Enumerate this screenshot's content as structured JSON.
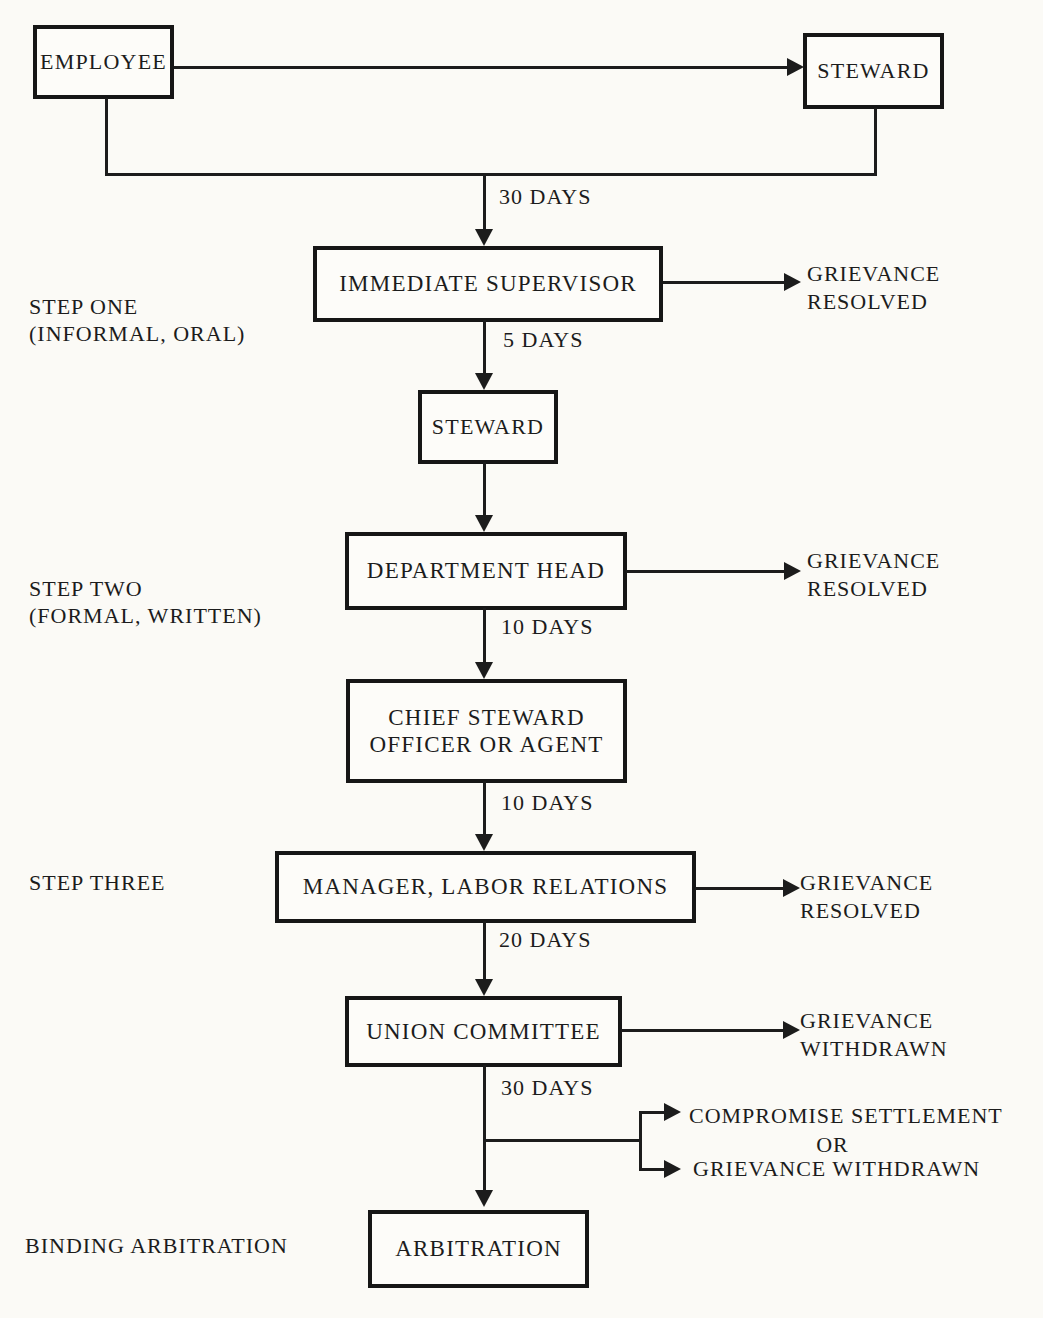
{
  "colors": {
    "ink": "#1c1c1c",
    "paper": "#fbfaf6",
    "box_fill": "#fdfcf9"
  },
  "boxes": {
    "employee": "EMPLOYEE",
    "steward_top": "STEWARD",
    "immediate_supervisor": "IMMEDIATE SUPERVISOR",
    "steward": "STEWARD",
    "department_head": "DEPARTMENT HEAD",
    "chief_steward": "CHIEF STEWARD\nOFFICER OR AGENT",
    "manager_labor_relations": "MANAGER, LABOR RELATIONS",
    "union_committee": "UNION COMMITTEE",
    "arbitration": "ARBITRATION"
  },
  "stage_labels": {
    "step_one": "STEP ONE\n(INFORMAL, ORAL)",
    "step_two": "STEP TWO\n(FORMAL, WRITTEN)",
    "step_three": "STEP THREE",
    "binding_arbitration": "BINDING ARBITRATION"
  },
  "durations": {
    "to_supervisor": "30 DAYS",
    "supervisor_to_steward": "5 DAYS",
    "department_head_to_chief": "10 DAYS",
    "chief_to_manager": "10 DAYS",
    "manager_to_union": "20 DAYS",
    "union_to_arbitration": "30 DAYS"
  },
  "outcomes": {
    "supervisor_resolved": "GRIEVANCE\nRESOLVED",
    "department_head_resolved": "GRIEVANCE\nRESOLVED",
    "manager_resolved": "GRIEVANCE\nRESOLVED",
    "union_withdrawn": "GRIEVANCE\nWITHDRAWN",
    "compromise_settlement": "COMPROMISE SETTLEMENT",
    "or": "OR",
    "grievance_withdrawn": "GRIEVANCE WITHDRAWN"
  }
}
